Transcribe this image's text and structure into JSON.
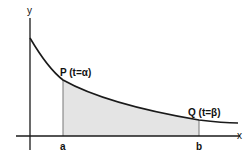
{
  "diagram": {
    "axes": {
      "x_label": "x",
      "y_label": "y"
    },
    "points": {
      "p": {
        "name": "P",
        "param": "(t=α)",
        "x_tick": "a"
      },
      "q": {
        "name": "Q",
        "param": "(t=β)",
        "x_tick": "b"
      }
    },
    "colors": {
      "stroke": "#1a1a1a",
      "shade": "#e4e4e4",
      "vertical": "#777777"
    }
  }
}
